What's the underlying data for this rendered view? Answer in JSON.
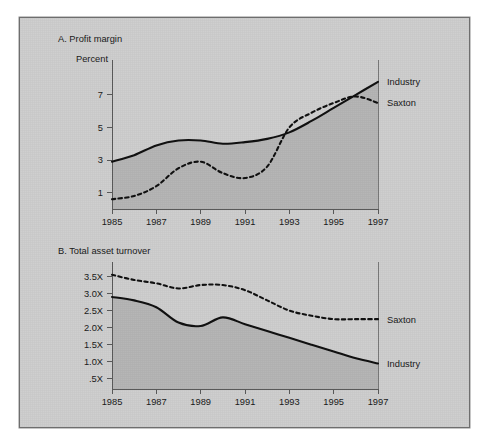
{
  "figure": {
    "panel_background": "#cfcfcf",
    "page_background": "#ffffff",
    "area_fill_color": "#b6b6b6",
    "line_color": "#111111"
  },
  "chart_data": [
    {
      "id": "chart-a",
      "type": "line",
      "title": "A. Profit margin",
      "subtitle": "Percent",
      "xlabel": "",
      "ylabel": "Percent",
      "grid": false,
      "legend_position": "right-of-plot",
      "x": [
        1985,
        1986,
        1987,
        1988,
        1989,
        1990,
        1991,
        1992,
        1993,
        1994,
        1995,
        1996,
        1997
      ],
      "xticks": [
        "1985",
        "1987",
        "1989",
        "1991",
        "1993",
        "1995",
        "1997"
      ],
      "xtick_values": [
        1985,
        1987,
        1989,
        1991,
        1993,
        1995,
        1997
      ],
      "yticks": [
        "1",
        "3",
        "5",
        "7"
      ],
      "ytick_values": [
        1,
        3,
        5,
        7
      ],
      "xlim": [
        1985,
        1997
      ],
      "ylim": [
        0,
        8.4
      ],
      "series": [
        {
          "name": "Industry",
          "style": "solid",
          "values": [
            2.9,
            3.3,
            3.9,
            4.2,
            4.2,
            4.0,
            4.1,
            4.3,
            4.7,
            5.4,
            6.2,
            7.0,
            7.8
          ]
        },
        {
          "name": "Saxton",
          "style": "dashed",
          "values": [
            0.6,
            0.8,
            1.4,
            2.5,
            2.9,
            2.2,
            1.9,
            2.6,
            5.0,
            5.9,
            6.5,
            6.9,
            6.5
          ]
        }
      ]
    },
    {
      "id": "chart-b",
      "type": "line",
      "title": "B. Total asset turnover",
      "subtitle": "",
      "xlabel": "",
      "ylabel": "",
      "grid": false,
      "legend_position": "right-of-plot",
      "x": [
        1985,
        1986,
        1987,
        1988,
        1989,
        1990,
        1991,
        1992,
        1993,
        1994,
        1995,
        1996,
        1997
      ],
      "xticks": [
        "1985",
        "1987",
        "1989",
        "1991",
        "1993",
        "1995",
        "1997"
      ],
      "xtick_values": [
        1985,
        1987,
        1989,
        1991,
        1993,
        1995,
        1997
      ],
      "yticks": [
        "3.5X",
        "3.0X",
        "2.5X",
        "2.0X",
        "1.5X",
        "1.0X",
        ".5X"
      ],
      "ytick_values": [
        3.5,
        3.0,
        2.5,
        2.0,
        1.5,
        1.0,
        0.5
      ],
      "xlim": [
        1985,
        1997
      ],
      "ylim": [
        0.2,
        3.75
      ],
      "series": [
        {
          "name": "Saxton",
          "style": "dashed",
          "values": [
            3.55,
            3.4,
            3.3,
            3.15,
            3.25,
            3.25,
            3.1,
            2.8,
            2.5,
            2.35,
            2.25,
            2.25,
            2.25
          ]
        },
        {
          "name": "Industry",
          "style": "solid",
          "values": [
            2.9,
            2.8,
            2.6,
            2.15,
            2.05,
            2.3,
            2.1,
            1.9,
            1.7,
            1.5,
            1.3,
            1.1,
            0.95
          ]
        }
      ]
    }
  ]
}
